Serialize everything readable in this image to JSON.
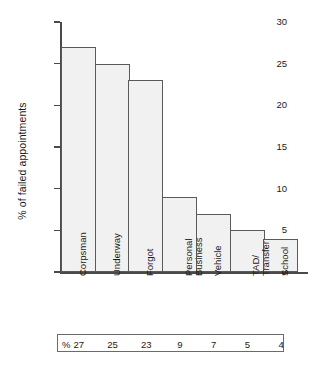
{
  "chart_data": {
    "type": "bar",
    "title": "",
    "xlabel": "",
    "ylabel": "% of failed appointments",
    "categories": [
      "Corpsman",
      "Underway",
      "Forgot",
      "Personal Business",
      "Vehicle",
      "TAD/Transfer",
      "School"
    ],
    "category_lines": [
      [
        "Corpsman"
      ],
      [
        "Underway"
      ],
      [
        "Forgot"
      ],
      [
        "Personal",
        "Business"
      ],
      [
        "Vehicle"
      ],
      [
        "TAD/",
        "Transfer"
      ],
      [
        "School"
      ]
    ],
    "values": [
      27,
      25,
      23,
      9,
      7,
      5,
      4
    ],
    "ylim": [
      0,
      30
    ],
    "yticks": [
      0,
      5,
      10,
      15,
      20,
      25,
      30
    ],
    "ytick_labels": [
      "0",
      "5",
      "10",
      "15",
      "20",
      "25",
      "30"
    ],
    "grid": false,
    "legend": null,
    "bar_fill_color": "#f1f1f1",
    "bar_edge_color": "#5a5a5a",
    "axis_color": "#4a4a4a",
    "background_color": "#ffffff"
  },
  "value_table": {
    "unit_symbol": "%",
    "values": [
      "27",
      "25",
      "23",
      "9",
      "7",
      "5",
      "4"
    ]
  }
}
